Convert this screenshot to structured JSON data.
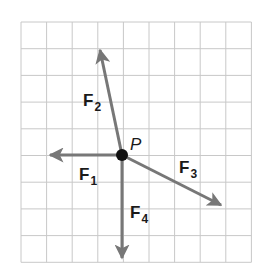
{
  "diagram": {
    "title": "",
    "grid": {
      "cols": 9,
      "rows": 9,
      "x0": 21,
      "y0": 22,
      "cell_w": 25.6,
      "cell_h": 26.7,
      "line_color": "#c8c8c8"
    },
    "point": {
      "label": "P",
      "grid": [
        4,
        5
      ],
      "color": "#111111"
    },
    "vector_color": "#777777",
    "vectors": [
      {
        "name": "F",
        "sub": "1",
        "dx": -3,
        "dy": 0
      },
      {
        "name": "F",
        "sub": "2",
        "dx": -1,
        "dy": -4
      },
      {
        "name": "F",
        "sub": "3",
        "dx": 4,
        "dy": 2
      },
      {
        "name": "F",
        "sub": "4",
        "dx": 0,
        "dy": 4
      }
    ]
  },
  "labels": {
    "P": "P",
    "F1": "F",
    "F1_sub": "1",
    "F2": "F",
    "F2_sub": "2",
    "F3": "F",
    "F3_sub": "3",
    "F4": "F",
    "F4_sub": "4"
  }
}
